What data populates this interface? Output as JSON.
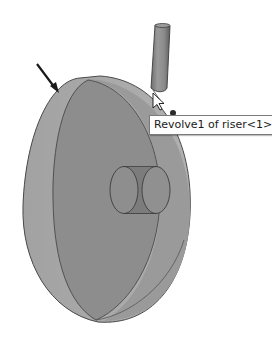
{
  "viewport": {
    "description": "3D CAD graphics area showing a revolved disk part",
    "background": "#ffffff"
  },
  "model": {
    "name": "riser",
    "colors": {
      "rim": "#a9a9a9",
      "front_face": "#8c8c8c",
      "back_face": "#999999",
      "edge": "#4a4a4a",
      "hole_fill": "#7d7d7d",
      "pen_body": "#8a8a8a"
    }
  },
  "tooltip": {
    "text": "Revolve1 of riser<1>"
  },
  "annotation": {
    "arrow_icon": "arrow-pointer",
    "color": "#1a1a1a"
  },
  "cursor": {
    "icon": "mouse-arrow-cursor"
  }
}
